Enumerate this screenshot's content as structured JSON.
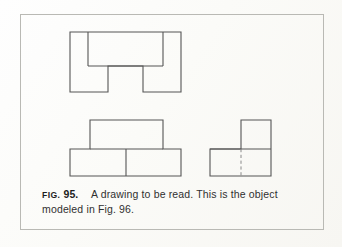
{
  "figure": {
    "label_prefix": "FIG.",
    "number": "95.",
    "caption_line1": "A drawing to be read. This is the",
    "caption_line2": "object modeled in Fig. 96.",
    "caption_full": "FIG. 95.  A drawing to be read. This is the object modeled in Fig. 96.",
    "frame": {
      "x": 20,
      "y": 14,
      "width": 304,
      "height": 216
    },
    "colors": {
      "paper": "#fdfdfb",
      "frame_line": "#b9b9b4",
      "object_line": "#555555",
      "hidden_line": "#8a8a8a",
      "caption_text": "#2e2e2e"
    }
  },
  "drawing": {
    "type": "orthographic-three-view",
    "description": "Three-view orthographic projection of a notched rectangular block",
    "views": [
      {
        "name": "top-view",
        "position": "upper-left",
        "outline_points": "70,32 181,32 181,92 143,92 143,66 108,66 108,92 70,92",
        "internal_lines": [
          {
            "name": "left-rib-line",
            "x1": 88,
            "y1": 32,
            "x2": 88,
            "y2": 66
          },
          {
            "name": "horizontal-rib-line",
            "x1": 88,
            "y1": 66,
            "x2": 163,
            "y2": 66
          },
          {
            "name": "right-rib-line",
            "x1": 163,
            "y1": 32,
            "x2": 163,
            "y2": 66
          }
        ]
      },
      {
        "name": "front-view",
        "position": "lower-left",
        "outline_points": "90,120 163,120 163,149 181,149 181,176 70,176 70,149 90,149",
        "internal_lines": [
          {
            "name": "left-step-line",
            "x1": 90,
            "y1": 149,
            "x2": 126,
            "y2": 149
          },
          {
            "name": "right-step-line",
            "x1": 126,
            "y1": 149,
            "x2": 163,
            "y2": 149
          },
          {
            "name": "left-block-divider",
            "x1": 126,
            "y1": 149,
            "x2": 126,
            "y2": 176
          }
        ]
      },
      {
        "name": "right-side-view",
        "position": "lower-right",
        "outline_points": "241,120 271,120 271,176 210,176 210,149 241,149",
        "internal_lines": [
          {
            "name": "side-step-line",
            "x1": 210,
            "y1": 149,
            "x2": 271,
            "y2": 149
          }
        ],
        "hidden_lines": [
          {
            "name": "hidden-edge-dashed",
            "x1": 241,
            "y1": 149,
            "x2": 241,
            "y2": 176
          }
        ]
      }
    ]
  }
}
